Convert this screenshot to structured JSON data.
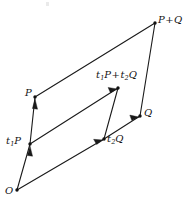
{
  "figure": {
    "type": "vector-parallelogram-diagram",
    "background_color": "#ffffff",
    "stroke_color": "#1a1a1a",
    "width": 196,
    "height": 208,
    "points": [
      {
        "id": "O",
        "label": "O",
        "x": 17,
        "y": 190
      },
      {
        "id": "t1P",
        "label": "t",
        "sub": "1",
        "rest": "P",
        "x": 30,
        "y": 144
      },
      {
        "id": "P",
        "label": "P",
        "x": 35,
        "y": 97
      },
      {
        "id": "t2Q",
        "label": "t",
        "sub": "2",
        "rest": "Q",
        "x": 104,
        "y": 139
      },
      {
        "id": "Q",
        "label": "Q",
        "x": 140,
        "y": 116
      },
      {
        "id": "sumInner",
        "label": "t1P+t2Q",
        "x": 118,
        "y": 88
      },
      {
        "id": "PplusQ",
        "label": "P+Q",
        "x": 155,
        "y": 23
      }
    ],
    "edges": [
      {
        "from": "O",
        "to": "P",
        "name": "edge-O-to-P",
        "arrows": 2
      },
      {
        "from": "O",
        "to": "Q",
        "name": "edge-O-to-Q",
        "arrows": 2
      },
      {
        "from": "P",
        "to": "PplusQ",
        "name": "edge-P-to-P-plus-Q",
        "arrows": 0
      },
      {
        "from": "Q",
        "to": "PplusQ",
        "name": "edge-Q-to-P-plus-Q",
        "arrows": 0
      },
      {
        "from": "t1P",
        "to": "sumInner",
        "name": "edge-t1P-to-sum",
        "arrows": 1
      },
      {
        "from": "t2Q",
        "to": "sumInner",
        "name": "edge-t2Q-to-sum",
        "arrows": 0
      }
    ]
  },
  "labels": {
    "origin": "O",
    "p": "P",
    "q": "Q",
    "p_plus_q_lead": "P",
    "p_plus_q_op": "+",
    "p_plus_q_tail": "Q",
    "t1_letter": "t",
    "t1_index": "1",
    "t1_vector": "P",
    "t2_letter": "t",
    "t2_index": "2",
    "t2_vector": "Q",
    "sum_op": "+"
  }
}
